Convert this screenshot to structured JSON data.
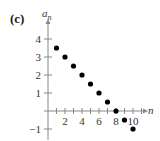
{
  "panel_label": "(c)",
  "chart_data": {
    "type": "scatter",
    "title": "",
    "xlabel": "n",
    "ylabel": "a_n",
    "x": [
      1,
      2,
      3,
      4,
      5,
      6,
      7,
      8,
      9,
      10
    ],
    "series": [
      {
        "name": "a_n",
        "values": [
          3.5,
          3,
          2.5,
          2,
          1.5,
          1,
          0.5,
          0,
          -0.5,
          -1
        ]
      }
    ],
    "xticks": [
      2,
      4,
      6,
      8,
      10
    ],
    "yticks": [
      -1,
      1,
      2,
      3,
      4
    ],
    "xlim": [
      0,
      11.5
    ],
    "ylim": [
      -1.5,
      4.8
    ],
    "grid": false,
    "legend": null,
    "marker_color": "#000000",
    "axis_color": "#888888"
  },
  "labels": {
    "y_axis": "a",
    "y_axis_sub": "n",
    "x_axis": "n"
  }
}
